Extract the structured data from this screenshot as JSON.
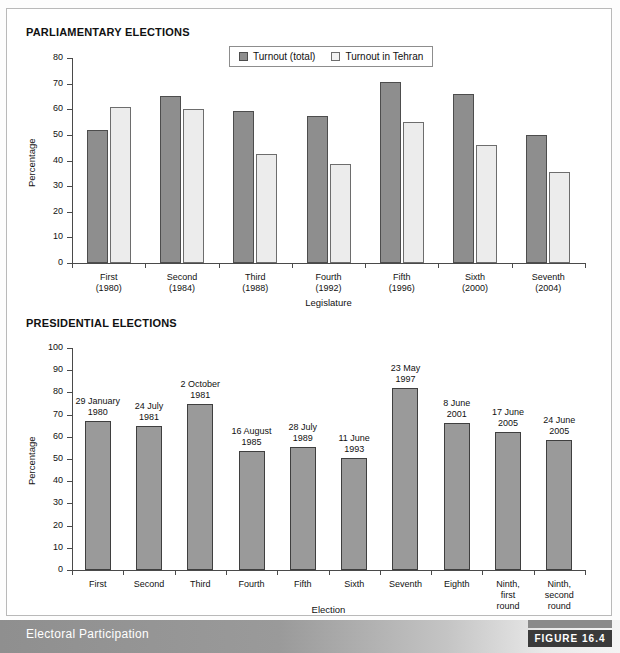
{
  "figure": {
    "caption": "Electoral Participation",
    "badge": "FIGURE 16.4"
  },
  "sections": {
    "parliamentary_title": "PARLIAMENTARY ELECTIONS",
    "presidential_title": "PRESIDENTIAL ELECTIONS"
  },
  "colors": {
    "series_total": "#8e8e8e",
    "series_tehran": "#ececec",
    "presidential_bar": "#9a9a9a",
    "axis": "#4a4a4a",
    "footer_band": "#9a9a9a",
    "badge_bg": "#3a3a3a"
  },
  "chart_data": [
    {
      "id": "parliamentary",
      "type": "bar",
      "title": "PARLIAMENTARY ELECTIONS",
      "xlabel": "Legislature",
      "ylabel": "Percentage",
      "ylim": [
        0,
        80
      ],
      "yticks": [
        0,
        10,
        20,
        30,
        40,
        50,
        60,
        70,
        80
      ],
      "ytick_labels": [
        "0",
        "10",
        "20",
        "30",
        "40",
        "50",
        "60",
        "70",
        "80"
      ],
      "grid": false,
      "legend_position": "top-center",
      "categories": [
        "First\n(1980)",
        "Second\n(1984)",
        "Third\n(1988)",
        "Fourth\n(1992)",
        "Fifth\n(1996)",
        "Sixth\n(2000)",
        "Seventh\n(2004)"
      ],
      "category_lines": [
        [
          "First",
          "(1980)"
        ],
        [
          "Second",
          "(1984)"
        ],
        [
          "Third",
          "(1988)"
        ],
        [
          "Fourth",
          "(1992)"
        ],
        [
          "Fifth",
          "(1996)"
        ],
        [
          "Sixth",
          "(2000)"
        ],
        [
          "Seventh",
          "(2004)"
        ]
      ],
      "series": [
        {
          "name": "Turnout (total)",
          "values": [
            52,
            65,
            59.5,
            57.5,
            70.5,
            66,
            50
          ]
        },
        {
          "name": "Turnout in Tehran",
          "values": [
            61,
            60,
            42.5,
            38.5,
            55,
            46,
            35.5
          ]
        }
      ]
    },
    {
      "id": "presidential",
      "type": "bar",
      "title": "PRESIDENTIAL ELECTIONS",
      "xlabel": "Election",
      "ylabel": "Percentage",
      "ylim": [
        0,
        100
      ],
      "yticks": [
        0,
        10,
        20,
        30,
        40,
        50,
        60,
        70,
        80,
        90,
        100
      ],
      "ytick_labels": [
        "0",
        "10",
        "20",
        "30",
        "40",
        "50",
        "60",
        "70",
        "80",
        "90",
        "100"
      ],
      "grid": false,
      "legend_position": "none",
      "categories": [
        "First",
        "Second",
        "Third",
        "Fourth",
        "Fifth",
        "Sixth",
        "Seventh",
        "Eighth",
        "Ninth, first round",
        "Ninth, second round"
      ],
      "category_lines": [
        [
          "First"
        ],
        [
          "Second"
        ],
        [
          "Third"
        ],
        [
          "Fourth"
        ],
        [
          "Fifth"
        ],
        [
          "Sixth"
        ],
        [
          "Seventh"
        ],
        [
          "Eighth"
        ],
        [
          "Ninth,",
          "first",
          "round"
        ],
        [
          "Ninth,",
          "second",
          "round"
        ]
      ],
      "values": [
        67,
        65,
        75,
        53.5,
        55.5,
        50.5,
        82,
        66,
        62,
        58.5
      ],
      "annotations": [
        [
          "29 January",
          "1980"
        ],
        [
          "24 July",
          "1981"
        ],
        [
          "2 October",
          "1981"
        ],
        [
          "16 August",
          "1985"
        ],
        [
          "28 July",
          "1989"
        ],
        [
          "11 June",
          "1993"
        ],
        [
          "23 May",
          "1997"
        ],
        [
          "8 June",
          "2001"
        ],
        [
          "17 June",
          "2005"
        ],
        [
          "24 June",
          "2005"
        ]
      ]
    }
  ]
}
